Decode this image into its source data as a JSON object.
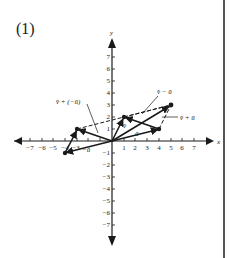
{
  "figure": {
    "panel_label": "(1)",
    "axes": {
      "x_label": "x",
      "y_label": "y",
      "x_ticks": [
        "−7",
        "−6",
        "−5",
        "−4",
        "−3",
        "1",
        "2",
        "3",
        "4",
        "5",
        "6",
        "7"
      ],
      "y_ticks": [
        "7",
        "6",
        "5",
        "4",
        "3",
        "2",
        "1",
        "−1",
        "−2",
        "−3",
        "−4",
        "−5",
        "−6",
        "−7"
      ]
    },
    "vectors": [
      {
        "name": "u",
        "label": "ū",
        "from": [
          0,
          0
        ],
        "to": [
          4,
          1
        ]
      },
      {
        "name": "v",
        "label": "v̄",
        "from": [
          0,
          0
        ],
        "to": [
          1,
          2
        ]
      },
      {
        "name": "v_plus_u",
        "label": "v̄ + ū",
        "from": [
          0,
          0
        ],
        "to": [
          5,
          3
        ]
      },
      {
        "name": "neg_u",
        "label": "−ū",
        "from": [
          0,
          0
        ],
        "to": [
          -4,
          -1
        ]
      },
      {
        "name": "v_plus_neg_u",
        "label": "v̄ + (−ū)",
        "from": [
          0,
          0
        ],
        "to": [
          -3,
          1
        ]
      },
      {
        "name": "v_minus_u",
        "label": "v̄ − ū",
        "from": [
          4,
          1
        ],
        "to": [
          1,
          2
        ]
      }
    ],
    "labels": {
      "u": "ū",
      "v": "v̄",
      "v_plus_u": "v̄ + ū",
      "v_minus_u": "v̄ − ū",
      "v_plus_neg_u": "v̄ + (−ū)",
      "neg_u": "−ū"
    }
  }
}
